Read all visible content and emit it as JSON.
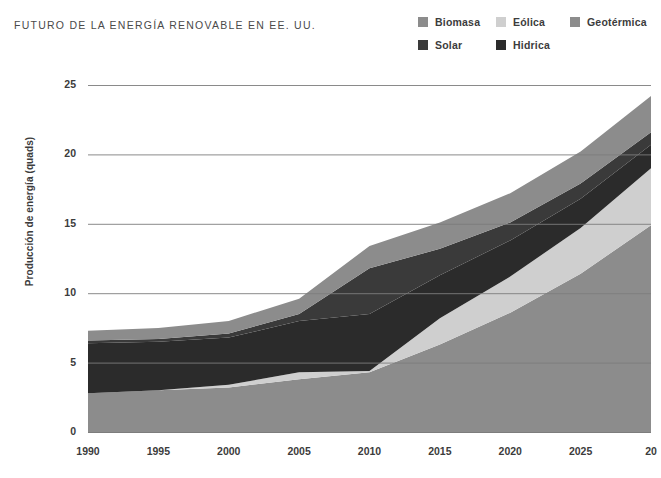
{
  "header": {
    "title": "FUTURO DE LA ENERGÍA RENOVABLE EN EE. UU."
  },
  "legend": {
    "position": "top-right",
    "items": [
      {
        "label": "Biomasa",
        "color": "#8c8c8c",
        "swatch_name": "legend-swatch-biomasa"
      },
      {
        "label": "Eólica",
        "color": "#cfcfcf",
        "swatch_name": "legend-swatch-eolica"
      },
      {
        "label": "Geotérmica",
        "color": "#8c8c8c",
        "swatch_name": "legend-swatch-geotermica"
      },
      {
        "label": "Solar",
        "color": "#3a3a3a",
        "swatch_name": "legend-swatch-solar"
      },
      {
        "label": "Hidrica",
        "color": "#2b2b2b",
        "swatch_name": "legend-swatch-hidrica"
      }
    ]
  },
  "axes": {
    "ylabel": "Producción de energía (quads)",
    "yticks": [
      "0",
      "5",
      "10",
      "15",
      "20",
      "25"
    ],
    "xticks": [
      "1990",
      "1995",
      "2000",
      "2005",
      "2010",
      "2015",
      "2020",
      "2025",
      "20"
    ]
  },
  "chart_data": {
    "type": "area",
    "title": "FUTURO DE LA ENERGÍA RENOVABLE EN EE. UU.",
    "xlabel": "",
    "ylabel": "Producción de energía (quads)",
    "stacked": true,
    "grid": true,
    "legend_position": "top-right",
    "xlim": [
      1990,
      2030
    ],
    "ylim": [
      0,
      25
    ],
    "x": [
      1990,
      1995,
      2000,
      2005,
      2010,
      2015,
      2020,
      2025,
      2030
    ],
    "xtick_labels": [
      "1990",
      "1995",
      "2000",
      "2005",
      "2010",
      "2015",
      "2020",
      "2025",
      "20"
    ],
    "ytick_values": [
      0,
      5,
      10,
      15,
      20,
      25
    ],
    "series": [
      {
        "name": "Biomasa",
        "color": "#8c8c8c",
        "values": [
          2.8,
          3.0,
          3.2,
          3.8,
          4.3,
          6.3,
          8.6,
          11.4,
          14.9
        ]
      },
      {
        "name": "Eólica",
        "color": "#cfcfcf",
        "values": [
          0.0,
          0.0,
          0.2,
          0.5,
          0.1,
          1.9,
          2.6,
          3.3,
          4.1
        ]
      },
      {
        "name": "Hidrica",
        "color": "#2b2b2b",
        "values": [
          3.6,
          3.5,
          3.4,
          3.7,
          4.1,
          3.1,
          2.6,
          2.1,
          1.7
        ]
      },
      {
        "name": "Solar",
        "color": "#3a3a3a",
        "values": [
          0.2,
          0.2,
          0.3,
          0.5,
          3.3,
          1.9,
          1.3,
          1.1,
          0.9
        ]
      },
      {
        "name": "Geotérmica",
        "color": "#8c8c8c",
        "values": [
          0.7,
          0.8,
          0.9,
          1.1,
          1.6,
          1.9,
          2.1,
          2.3,
          2.6
        ]
      }
    ],
    "totals": [
      7.3,
      7.5,
      8.0,
      9.6,
      13.4,
      15.1,
      17.2,
      20.2,
      24.2
    ]
  },
  "style": {
    "background": "#ffffff",
    "grid_color": "#7d7d7d",
    "text_color": "#3c3c3c",
    "plot_left": 88,
    "plot_right": 651,
    "plot_top": 85,
    "plot_bottom": 432
  }
}
